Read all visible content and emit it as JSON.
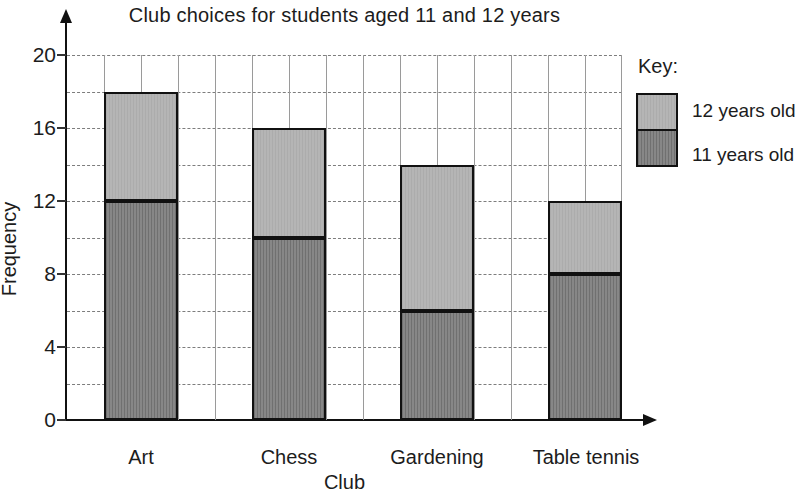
{
  "title": "Club choices for students aged 11 and 12 years",
  "chart_data": {
    "type": "bar",
    "stacked": true,
    "title": "Club choices for students aged 11 and 12 years",
    "categories": [
      "Art",
      "Chess",
      "Gardening",
      "Table tennis"
    ],
    "series": [
      {
        "name": "11 years old",
        "values": [
          12,
          10,
          6,
          8
        ],
        "color": "#828282"
      },
      {
        "name": "12 years old",
        "values": [
          6,
          6,
          8,
          4
        ],
        "color": "#b5b5b5"
      }
    ],
    "totals": [
      18,
      16,
      14,
      12
    ],
    "xlabel": "Club",
    "ylabel": "Frequency",
    "ylim": [
      0,
      20
    ],
    "yticks": [
      "20",
      "16",
      "12",
      "8",
      "4",
      "0"
    ],
    "ytick_values": [
      20,
      16,
      12,
      8,
      4,
      0
    ],
    "minor_grid_step": 2,
    "grid": "on",
    "legend_position": "right"
  },
  "legend": {
    "title": "Key:",
    "items": [
      {
        "label": "12 years old",
        "color": "#b5b5b5"
      },
      {
        "label": "11 years old",
        "color": "#828282"
      }
    ]
  }
}
